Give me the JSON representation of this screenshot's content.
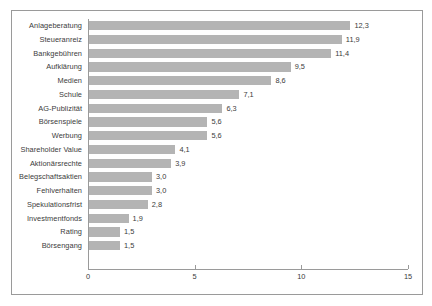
{
  "chart_data": {
    "type": "bar",
    "orientation": "horizontal",
    "title": "",
    "xlabel": "",
    "ylabel": "",
    "xlim": [
      0,
      15
    ],
    "xticks": [
      "0",
      "5",
      "10",
      "15"
    ],
    "grid": false,
    "legend": false,
    "decimal_separator": ",",
    "bar_color": "#b4b4b4",
    "axis_color": "#9a9a9a",
    "text_color": "#3b3b3b",
    "categories": [
      "Anlageberatung",
      "Steueranreiz",
      "Bankgebühren",
      "Aufklärung",
      "Medien",
      "Schule",
      "AG-Publizität",
      "Börsenspiele",
      "Werbung",
      "Shareholder Value",
      "Aktionärsrechte",
      "Belegschaftsaktien",
      "Fehlverhalten",
      "Spekulationsfrist",
      "Investmentfonds",
      "Rating",
      "Börsengang"
    ],
    "values": [
      12.3,
      11.9,
      11.4,
      9.5,
      8.6,
      7.1,
      6.3,
      5.6,
      5.6,
      4.1,
      3.9,
      3.0,
      3.0,
      2.8,
      1.9,
      1.5,
      1.5
    ],
    "value_labels": [
      "12,3",
      "11,9",
      "11,4",
      "9,5",
      "8,6",
      "7,1",
      "6,3",
      "5,6",
      "5,6",
      "4,1",
      "3,9",
      "3,0",
      "3,0",
      "2,8",
      "1,9",
      "1,5",
      "1,5"
    ]
  }
}
